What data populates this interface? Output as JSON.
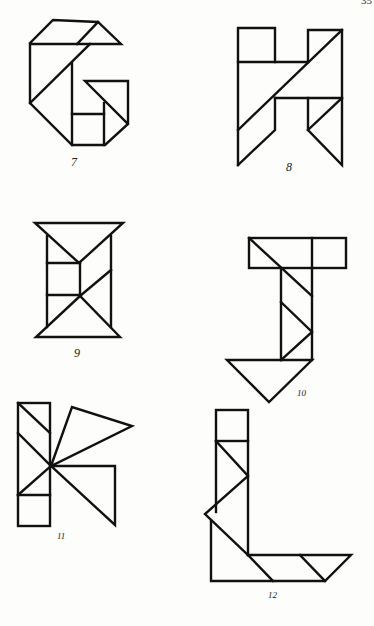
{
  "page": {
    "page_number": "35",
    "figures": [
      {
        "number": "7",
        "letter": "G"
      },
      {
        "number": "8",
        "letter": "H"
      },
      {
        "number": "9",
        "letter": "I"
      },
      {
        "number": "10",
        "letter": "J"
      },
      {
        "number": "11",
        "letter": "K"
      },
      {
        "number": "12",
        "letter": "L"
      }
    ]
  },
  "style": {
    "line_color": "#111111",
    "background": "#fdfdfb"
  }
}
